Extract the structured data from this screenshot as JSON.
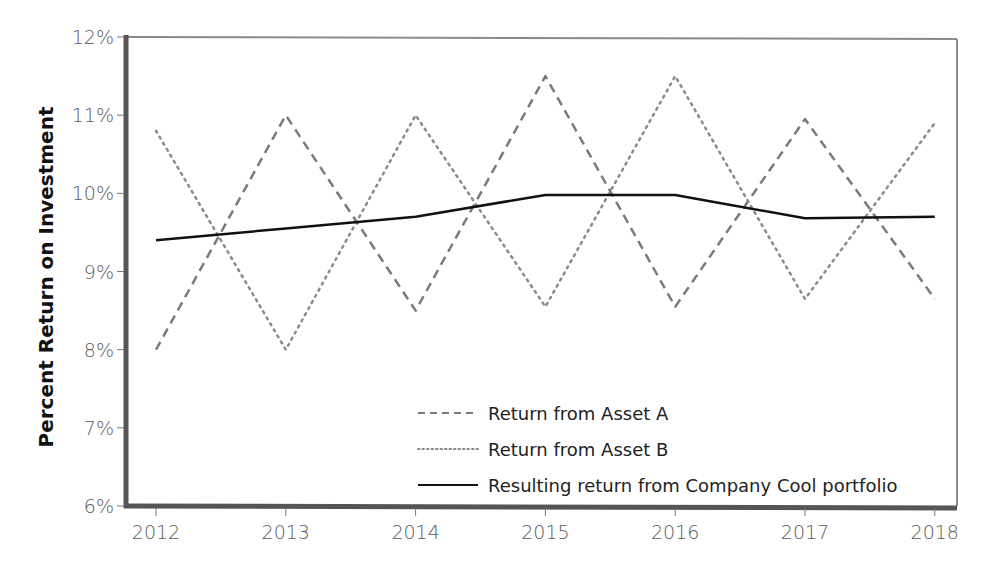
{
  "chart_data": {
    "type": "line",
    "title": "",
    "xlabel": "",
    "ylabel": "Percent Return on Investment",
    "categories": [
      "2012",
      "2013",
      "2014",
      "2015",
      "2016",
      "2017",
      "2018"
    ],
    "series": [
      {
        "name": "Return from Asset A",
        "style": "dashed",
        "color": "#7a7a7a",
        "values": [
          8.0,
          11.0,
          8.5,
          11.5,
          8.55,
          10.95,
          8.65
        ]
      },
      {
        "name": "Return from Asset B",
        "style": "dotted",
        "color": "#8a8a8a",
        "values": [
          10.8,
          8.0,
          11.0,
          8.55,
          11.5,
          8.65,
          10.9
        ]
      },
      {
        "name": "Resulting return from Company Cool portfolio",
        "style": "solid",
        "color": "#111111",
        "values": [
          9.4,
          9.55,
          9.7,
          9.98,
          9.98,
          9.68,
          9.7
        ]
      }
    ],
    "ylim": [
      6,
      12
    ],
    "yticks": [
      "6%",
      "7%",
      "8%",
      "9%",
      "10%",
      "11%",
      "12%"
    ],
    "ytick_values": [
      6,
      7,
      8,
      9,
      10,
      11,
      12
    ],
    "grid": false,
    "legend_position": "lower right inside"
  }
}
